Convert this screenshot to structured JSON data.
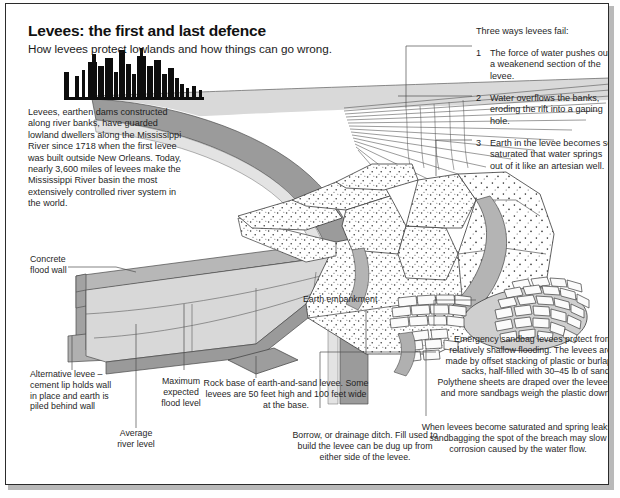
{
  "meta": {
    "kind": "infographic-diagram",
    "width": 620,
    "height": 498
  },
  "header": {
    "title": "Levees: the first and last defence",
    "subtitle": "How levees protect lowlands and how things can go wrong."
  },
  "intro": {
    "text": "Levees, earthen dams constructed along river banks, have guarded lowland dwellers along the Mississippi River since 1718 when the first levee was built outside New Orleans. Today, nearly 3,600 miles of levees make the Mississippi River basin the most extensively controlled river system in the world."
  },
  "fail_panel": {
    "heading": "Three ways levees fail:",
    "items": [
      {
        "num": "1",
        "text": "The force of water pushes out a weakenend section of the levee."
      },
      {
        "num": "2",
        "text": "Water overflows the banks, eroding the rift into a gaping hole."
      },
      {
        "num": "3",
        "text": "Earth in the levee becomes so saturated that water springs out of it like an artesian well."
      }
    ]
  },
  "callouts": {
    "concrete_flood_wall": "Concrete\nflood wall",
    "earth_embankment": "Earth embankment",
    "alternative_levee": "Alternative levee – cement lip holds wall in place and earth is piled behind wall",
    "maximum_expected_flood_level": "Maximum\nexpected\nflood level",
    "average_river_level": "Average\nriver level",
    "rock_base": "Rock base of earth-and-sand levee. Some levees are 50 feet high and 100 feet wide at the base.",
    "borrow_ditch": "Borrow, or drainage ditch. Fill used to build the levee can be dug up from either side of the levee.",
    "emergency_sandbag": "Emergency sandbag levees protect from relatively shallow flooding. The levees are made by offset stacking of plastic or burlap sacks, half-filled with 30–45 lb of sand. Polythene sheets are draped over the levees and more sandbags weigh the plastic down.",
    "saturated_note": "When levees become saturated and spring leaks, sandbagging the spot of the breach may slow corrosion caused by the water flow."
  },
  "colors": {
    "ink": "#1f1f1f",
    "frame": "#2b2b2b",
    "shadow": "#b9b9b9",
    "water_dark": "#8f8f8f",
    "water_mid": "#a8a8a8",
    "concrete_top": "#bdbdbd",
    "concrete_face": "#8d8d8d",
    "embankment_slope": "#d6d6d6",
    "embankment_light": "#e7e7e7",
    "earth_fill": "#ffffff",
    "sandbag_fill": "#cfcfcf",
    "stone_fill": "#f4f4f4",
    "leader": "#5a5a5a"
  },
  "graphics": {
    "skyline_label": "city-skyline-silhouette",
    "river_label": "river-water-surface",
    "spray_label": "overflow-water-streaks",
    "sandbag_label": "sandbag-stack",
    "stipple_label": "earth-fill-stipple"
  }
}
